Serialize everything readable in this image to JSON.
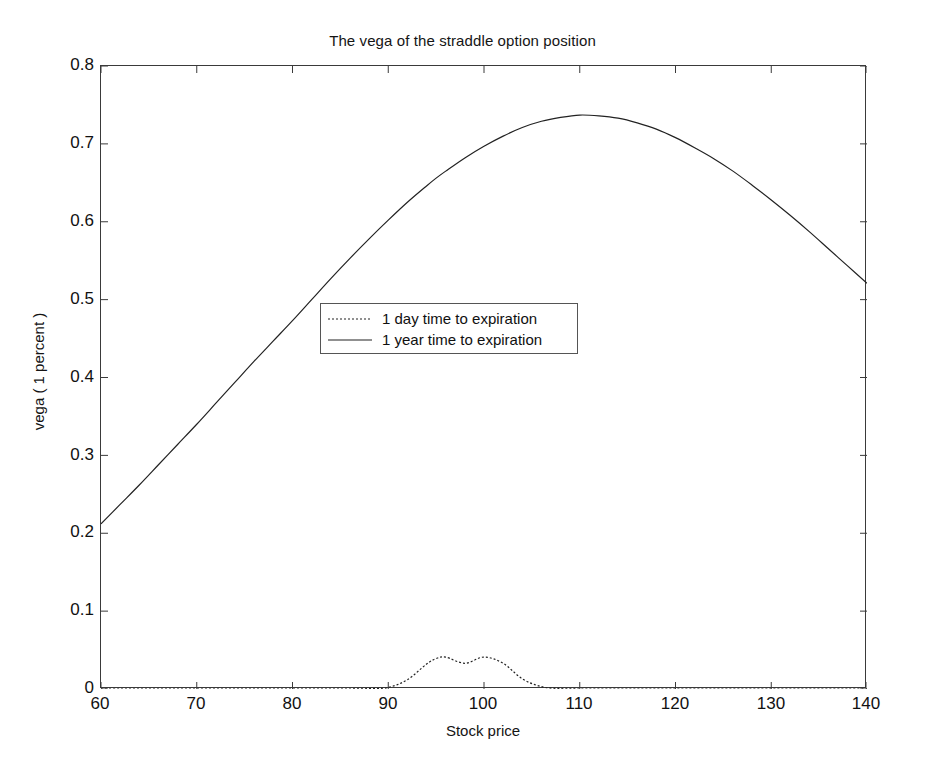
{
  "chart_data": {
    "type": "line",
    "title": "The vega of the straddle option position",
    "xlabel": "Stock price",
    "ylabel": "vega ( 1 percent )",
    "xlim": [
      60,
      140
    ],
    "ylim": [
      0,
      0.8
    ],
    "xticks": [
      60,
      70,
      80,
      90,
      100,
      110,
      120,
      130,
      140
    ],
    "yticks": [
      0,
      0.1,
      0.2,
      0.3,
      0.4,
      0.5,
      0.6,
      0.7,
      0.8
    ],
    "xtick_labels": [
      "60",
      "70",
      "80",
      "90",
      "100",
      "110",
      "120",
      "130",
      "140"
    ],
    "ytick_labels": [
      "0",
      "0.1",
      "0.2",
      "0.3",
      "0.4",
      "0.5",
      "0.6",
      "0.7",
      "0.8"
    ],
    "grid": false,
    "legend_position": "center",
    "box": true,
    "x": [
      60,
      62,
      64,
      66,
      68,
      70,
      72,
      74,
      76,
      78,
      80,
      82,
      84,
      86,
      88,
      90,
      92,
      94,
      95,
      96,
      98,
      100,
      102,
      104,
      106,
      108,
      110,
      112,
      114,
      116,
      118,
      120,
      122,
      124,
      126,
      128,
      130,
      132,
      134,
      136,
      138,
      140
    ],
    "series": [
      {
        "name": "1 day time to expiration",
        "style": "dotted",
        "color": "#222222",
        "values": [
          0.0,
          0.0,
          0.0,
          0.0,
          0.0,
          0.0,
          0.0,
          0.0,
          0.0,
          0.0,
          0.0,
          0.0,
          0.0,
          0.0,
          0.0005,
          0.002,
          0.012,
          0.032,
          0.039,
          0.041,
          0.033,
          0.041,
          0.033,
          0.013,
          0.003,
          0.0005,
          0.0,
          0.0,
          0.0,
          0.0,
          0.0,
          0.0,
          0.0,
          0.0,
          0.0,
          0.0,
          0.0,
          0.0,
          0.0,
          0.0,
          0.0,
          0.0
        ]
      },
      {
        "name": "1 year time to expiration",
        "style": "solid",
        "color": "#222222",
        "values": [
          0.212,
          0.237,
          0.262,
          0.288,
          0.314,
          0.34,
          0.367,
          0.394,
          0.421,
          0.447,
          0.473,
          0.5,
          0.527,
          0.553,
          0.578,
          0.602,
          0.625,
          0.646,
          0.656,
          0.665,
          0.682,
          0.697,
          0.71,
          0.721,
          0.729,
          0.734,
          0.737,
          0.736,
          0.733,
          0.727,
          0.719,
          0.708,
          0.695,
          0.681,
          0.665,
          0.647,
          0.628,
          0.608,
          0.587,
          0.565,
          0.543,
          0.521
        ]
      }
    ],
    "annotations": {
      "peak_value": 0.737,
      "peak_note": "1 year curve peaks near vega 0.737",
      "day_peak_value": 0.041,
      "day_peak_note": "1 day curve spike peaks at stock price 100"
    }
  },
  "legend": {
    "items": [
      {
        "label": "1 day time to expiration",
        "style": "dotted"
      },
      {
        "label": "1 year time to expiration",
        "style": "solid"
      }
    ]
  }
}
